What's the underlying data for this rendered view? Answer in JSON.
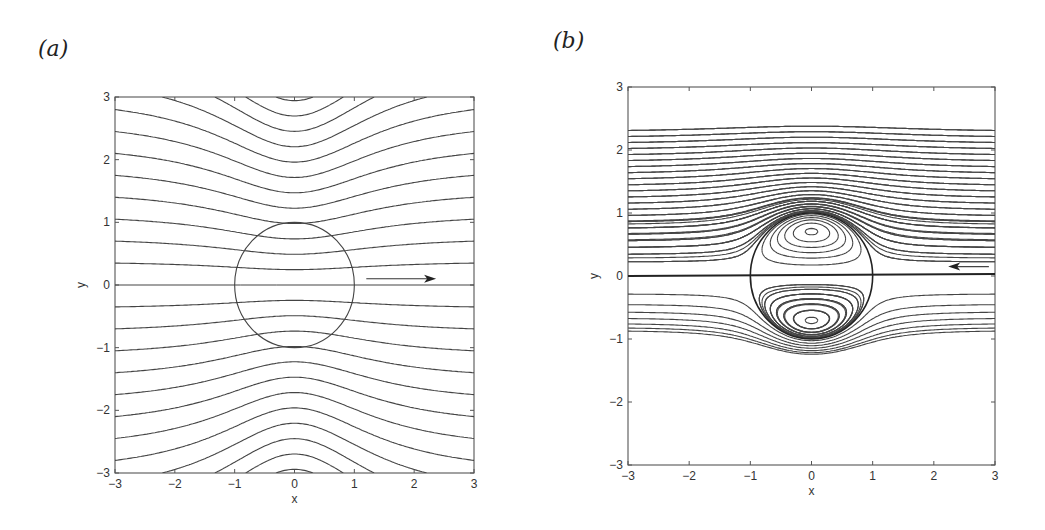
{
  "figure": {
    "panels": [
      {
        "id": "a",
        "label": "(a)"
      },
      {
        "id": "b",
        "label": "(b)"
      }
    ]
  },
  "chart_data": [
    {
      "type": "line",
      "panel": "(a)",
      "title": "",
      "xlabel": "x",
      "ylabel": "y",
      "xlim": [
        -3,
        3
      ],
      "ylim": [
        -3,
        3
      ],
      "xticks": [
        "-3",
        "-2",
        "-1",
        "0",
        "1",
        "2",
        "3"
      ],
      "yticks": [
        "-3",
        "-2",
        "-1",
        "0",
        "1",
        "2",
        "3"
      ],
      "grid": false,
      "description": "Streamlines of flow past a unit circle (streamlines pass through the circle), flow direction left to right",
      "circle": {
        "cx": 0,
        "cy": 0,
        "r": 1
      },
      "arrow": {
        "from": [
          1.2,
          0.1
        ],
        "to": [
          2.3,
          0.1
        ],
        "direction": "right"
      },
      "streamline_count": 24,
      "line_color": "#444444"
    },
    {
      "type": "line",
      "panel": "(b)",
      "title": "",
      "xlabel": "x",
      "ylabel": "y",
      "xlim": [
        -3,
        3
      ],
      "ylim": [
        -3,
        3
      ],
      "xticks": [
        "-3",
        "-2",
        "-1",
        "0",
        "1",
        "2",
        "3"
      ],
      "yticks": [
        "-3",
        "-2",
        "-1",
        "0",
        "1",
        "2",
        "3"
      ],
      "grid": false,
      "description": "Streamlines of flow past a spherical vortex: closed recirculating eddies inside the unit circle centered near y=±0.7, external flow right to left, dividing streamline along y=0",
      "circle": {
        "cx": 0,
        "cy": 0,
        "r": 1
      },
      "eddy_centers": [
        [
          0,
          0.72
        ],
        [
          0,
          -0.65
        ]
      ],
      "arrow": {
        "from": [
          2.9,
          0.15
        ],
        "to": [
          2.3,
          0.15
        ],
        "direction": "left"
      },
      "streamline_count": 40,
      "line_color": "#444444"
    }
  ]
}
